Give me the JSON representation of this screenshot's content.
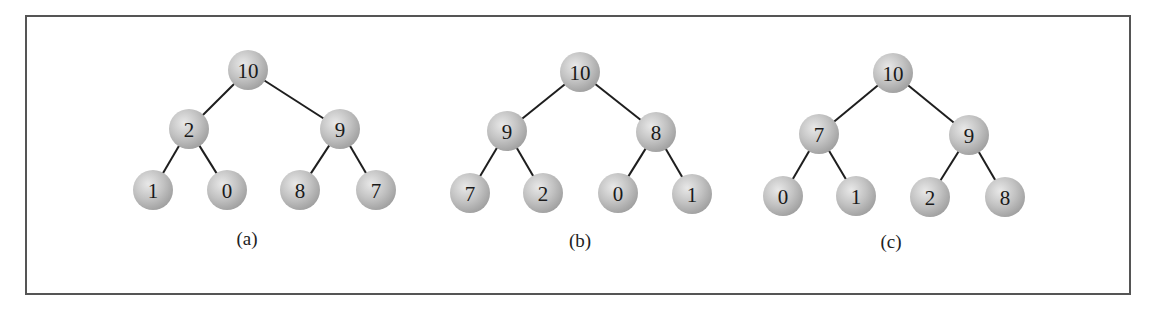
{
  "figure": {
    "node_fill": "#b8b8b8",
    "node_highlight": "#e6e6e6",
    "edge_color": "#1e1e1e",
    "border_color": "#555555",
    "trees": [
      {
        "caption": "(a)",
        "caption_pos": [
          247,
          238
        ],
        "nodes": [
          {
            "id": 0,
            "label": "10",
            "x": 248,
            "y": 70
          },
          {
            "id": 1,
            "label": "2",
            "x": 189,
            "y": 129
          },
          {
            "id": 2,
            "label": "9",
            "x": 340,
            "y": 129
          },
          {
            "id": 3,
            "label": "1",
            "x": 153,
            "y": 190
          },
          {
            "id": 4,
            "label": "0",
            "x": 227,
            "y": 190
          },
          {
            "id": 5,
            "label": "8",
            "x": 300,
            "y": 190
          },
          {
            "id": 6,
            "label": "7",
            "x": 376,
            "y": 190
          }
        ]
      },
      {
        "caption": "(b)",
        "caption_pos": [
          580,
          240
        ],
        "nodes": [
          {
            "id": 0,
            "label": "10",
            "x": 580,
            "y": 72
          },
          {
            "id": 1,
            "label": "9",
            "x": 507,
            "y": 131
          },
          {
            "id": 2,
            "label": "8",
            "x": 656,
            "y": 132
          },
          {
            "id": 3,
            "label": "7",
            "x": 470,
            "y": 193
          },
          {
            "id": 4,
            "label": "2",
            "x": 543,
            "y": 193
          },
          {
            "id": 5,
            "label": "0",
            "x": 618,
            "y": 193
          },
          {
            "id": 6,
            "label": "1",
            "x": 692,
            "y": 194
          }
        ]
      },
      {
        "caption": "(c)",
        "caption_pos": [
          891,
          241
        ],
        "nodes": [
          {
            "id": 0,
            "label": "10",
            "x": 893,
            "y": 73
          },
          {
            "id": 1,
            "label": "7",
            "x": 819,
            "y": 134
          },
          {
            "id": 2,
            "label": "9",
            "x": 969,
            "y": 135
          },
          {
            "id": 3,
            "label": "0",
            "x": 783,
            "y": 196
          },
          {
            "id": 4,
            "label": "1",
            "x": 856,
            "y": 196
          },
          {
            "id": 5,
            "label": "2",
            "x": 930,
            "y": 197
          },
          {
            "id": 6,
            "label": "8",
            "x": 1005,
            "y": 197
          }
        ]
      }
    ],
    "edges": [
      [
        0,
        1
      ],
      [
        0,
        2
      ],
      [
        1,
        3
      ],
      [
        1,
        4
      ],
      [
        2,
        5
      ],
      [
        2,
        6
      ]
    ],
    "node_radius": 20
  }
}
